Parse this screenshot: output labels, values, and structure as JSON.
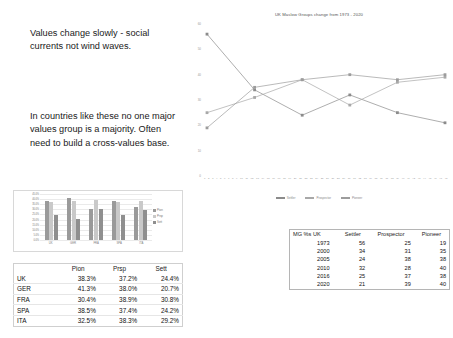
{
  "slide": {
    "text_blocks": [
      "Values change slowly - social currents not wind waves.",
      "In countries like these no one major values group is a majority. Often need to build a cross-values base."
    ]
  },
  "chart_data": [
    {
      "type": "line",
      "title": "UK Maslow Groups change from 1973 - 2020",
      "xlabel": "",
      "ylabel": "",
      "ylim": [
        0,
        60
      ],
      "grid": false,
      "legend_position": "bottom",
      "x": [
        1973,
        2000,
        2005,
        2010,
        2016,
        2020
      ],
      "xtick_labels": [
        "1",
        "2",
        "3",
        "4",
        "5",
        "6",
        "7",
        "8",
        "9",
        "10",
        "11",
        "12",
        "13",
        "14",
        "15",
        "16",
        "17",
        "18",
        "19",
        "20",
        "21",
        "22",
        "23",
        "24",
        "25",
        "26",
        "27",
        "28",
        "29",
        "30",
        "31",
        "32",
        "33",
        "34",
        "35",
        "36",
        "37",
        "38",
        "39",
        "40",
        "41",
        "42",
        "43",
        "44",
        "45",
        "46",
        "47",
        "48"
      ],
      "series": [
        {
          "name": "Settler",
          "values": [
            56,
            34,
            24,
            32,
            25,
            21
          ],
          "color": "#8b8b8b"
        },
        {
          "name": "Prospector",
          "values": [
            25,
            31,
            38,
            28,
            37,
            39
          ],
          "color": "#a8a8a8"
        },
        {
          "name": "Pioneer",
          "values": [
            19,
            35,
            38,
            40,
            38,
            40
          ],
          "color": "#9c9c9c"
        }
      ]
    },
    {
      "type": "bar",
      "title": "",
      "xlabel": "",
      "ylabel": "",
      "ylim": [
        0,
        45
      ],
      "grid": true,
      "legend_position": "right",
      "categories": [
        "UK",
        "GER",
        "FRA",
        "SPA",
        "ITA"
      ],
      "ytick_labels": [
        "45.0%",
        "40.0%",
        "35.0%",
        "30.0%",
        "25.0%",
        "20.0%",
        "15.0%",
        "10.0%",
        "5.0%",
        "0.0%"
      ],
      "series": [
        {
          "name": "Pion",
          "values": [
            38.3,
            41.3,
            30.4,
            38.5,
            32.5
          ],
          "color": "#9a9a9a"
        },
        {
          "name": "Prsp",
          "values": [
            37.2,
            38.0,
            38.9,
            37.4,
            38.3
          ],
          "color": "#c9c9c9"
        },
        {
          "name": "Sett",
          "values": [
            24.4,
            20.7,
            30.8,
            24.2,
            29.2
          ],
          "color": "#8f8f8f"
        }
      ]
    }
  ],
  "country_table": {
    "headers": [
      "",
      "Pion",
      "Prsp",
      "Sett"
    ],
    "rows": [
      {
        "country": "UK",
        "pion": "38.3%",
        "prsp": "37.2%",
        "sett": "24.4%"
      },
      {
        "country": "GER",
        "pion": "41.3%",
        "prsp": "38.0%",
        "sett": "20.7%"
      },
      {
        "country": "FRA",
        "pion": "30.4%",
        "prsp": "38.9%",
        "sett": "30.8%"
      },
      {
        "country": "SPA",
        "pion": "38.5%",
        "prsp": "37.4%",
        "sett": "24.2%"
      },
      {
        "country": "ITA",
        "pion": "32.5%",
        "prsp": "38.3%",
        "sett": "29.2%"
      }
    ]
  },
  "mg_table": {
    "headers": [
      "MG %s UK",
      "Settler",
      "Prospector",
      "Pioneer"
    ],
    "rows": [
      {
        "year": "1973",
        "settler": "56",
        "prospector": "25",
        "pioneer": "19"
      },
      {
        "year": "2000",
        "settler": "34",
        "prospector": "31",
        "pioneer": "35"
      },
      {
        "year": "2005",
        "settler": "24",
        "prospector": "38",
        "pioneer": "38"
      },
      {
        "year": "2010",
        "settler": "32",
        "prospector": "28",
        "pioneer": "40"
      },
      {
        "year": "2016",
        "settler": "25",
        "prospector": "37",
        "pioneer": "38"
      },
      {
        "year": "2020",
        "settler": "21",
        "prospector": "39",
        "pioneer": "40"
      }
    ]
  }
}
